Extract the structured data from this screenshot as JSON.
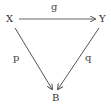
{
  "diagram": {
    "nodes": [
      {
        "id": "X",
        "label": "X"
      },
      {
        "id": "Y",
        "label": "Y"
      },
      {
        "id": "B",
        "label": "B"
      }
    ],
    "edges": [
      {
        "from": "X",
        "to": "Y",
        "label": "g"
      },
      {
        "from": "X",
        "to": "B",
        "label": "p"
      },
      {
        "from": "Y",
        "to": "B",
        "label": "q"
      }
    ],
    "colors": {
      "stroke": "#555555",
      "text": "#333333"
    }
  }
}
